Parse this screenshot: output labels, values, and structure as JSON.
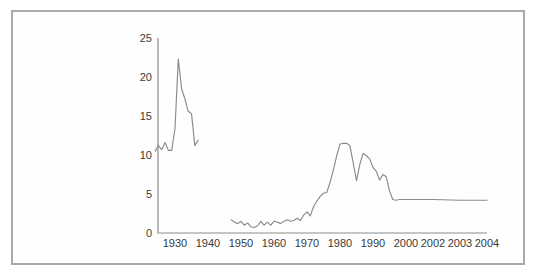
{
  "figure": {
    "border_color": "#a9a9a9",
    "background": "#ffffff",
    "line_color": "#8a8a8a",
    "text_color": "#3a3a3a"
  },
  "chart_data": {
    "type": "line",
    "title": "",
    "subtitle": "",
    "xlabel": "",
    "ylabel": "",
    "grid": false,
    "legend": "none",
    "ylim": [
      0,
      25
    ],
    "yticks": [
      0,
      5,
      10,
      15,
      20,
      25
    ],
    "ytick_labels": [
      "0",
      "5",
      "10",
      "15",
      "20",
      "25"
    ],
    "xtick_labels": [
      "1930",
      "1940",
      "1950",
      "1960",
      "1970",
      "1980",
      "1990",
      "2000",
      "2002",
      "2003",
      "2004"
    ],
    "xtick_values": [
      1930,
      1940,
      1950,
      1960,
      1970,
      1980,
      1990,
      2000,
      2002,
      2003,
      2004
    ],
    "x_axis_note": "compressed non-linear spacing after 2000",
    "series": [
      {
        "name": "early-period",
        "x": [
          1924,
          1925,
          1926,
          1927,
          1928,
          1929,
          1930,
          1931,
          1932,
          1933,
          1934,
          1935,
          1936,
          1937
        ],
        "values": [
          10.5,
          11.2,
          10.7,
          11.6,
          10.6,
          10.6,
          13.4,
          22.3,
          18.5,
          17.2,
          15.6,
          15.3,
          11.2,
          11.9
        ]
      },
      {
        "name": "main-period",
        "x": [
          1947,
          1948,
          1949,
          1950,
          1951,
          1952,
          1953,
          1954,
          1955,
          1956,
          1957,
          1958,
          1959,
          1960,
          1961,
          1962,
          1963,
          1964,
          1965,
          1966,
          1967,
          1968,
          1969,
          1970,
          1971,
          1972,
          1973,
          1974,
          1975,
          1976,
          1977,
          1978,
          1979,
          1980,
          1981,
          1982,
          1983,
          1984,
          1985,
          1986,
          1987,
          1988,
          1989,
          1990,
          1991,
          1992,
          1993,
          1994,
          1995,
          1996,
          1997,
          1998,
          1999,
          2000,
          2001,
          2002,
          2003,
          2004
        ],
        "values": [
          1.7,
          1.4,
          1.2,
          1.5,
          1.0,
          1.3,
          0.8,
          0.7,
          0.9,
          1.5,
          1.0,
          1.4,
          1.0,
          1.5,
          1.4,
          1.2,
          1.5,
          1.7,
          1.5,
          1.6,
          1.9,
          1.6,
          2.3,
          2.7,
          2.2,
          3.4,
          4.1,
          4.7,
          5.1,
          5.2,
          6.5,
          8.1,
          9.9,
          11.4,
          11.5,
          11.5,
          11.2,
          9.0,
          6.7,
          8.8,
          10.2,
          9.9,
          9.5,
          8.4,
          7.9,
          6.8,
          7.5,
          7.2,
          5.4,
          4.3,
          4.2,
          4.3,
          4.3,
          4.3,
          4.3,
          4.3,
          4.2,
          4.2
        ]
      }
    ]
  }
}
